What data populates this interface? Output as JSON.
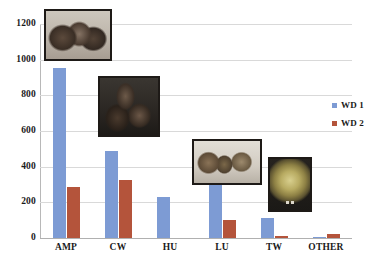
{
  "chart_data": {
    "type": "bar",
    "title": "",
    "subtitle": "",
    "xlabel": "",
    "ylabel": "",
    "categories": [
      "AMP",
      "CW",
      "HU",
      "LU",
      "TW",
      "OTHER"
    ],
    "series": [
      {
        "name": "WD 1",
        "color": "#7d9bd4",
        "values": [
          955,
          488,
          230,
          308,
          112,
          5
        ]
      },
      {
        "name": "WD 2",
        "color": "#b4543b",
        "values": [
          285,
          325,
          0,
          100,
          10,
          22
        ]
      }
    ],
    "ylim": [
      0,
      1200
    ],
    "yticks": [
      0,
      200,
      400,
      600,
      800,
      1000,
      1200
    ],
    "ytick_labels": [
      "0",
      "200",
      "400",
      "600",
      "800",
      "1000",
      "1200"
    ],
    "grid": true,
    "grid_axis": "y",
    "legend_position": "right",
    "legend_entries": [
      "WD 1",
      "WD 2"
    ]
  },
  "legend": {
    "items": [
      {
        "label": "WD 1",
        "color": "#7d9bd4"
      },
      {
        "label": "WD 2",
        "color": "#b4543b"
      }
    ]
  },
  "insets": [
    {
      "name": "amphorae-photo",
      "caption": ""
    },
    {
      "name": "jugs-photo",
      "caption": ""
    },
    {
      "name": "sherds-photo",
      "caption": ""
    },
    {
      "name": "glazed-dish-photo",
      "caption": ""
    }
  ],
  "colors": {
    "series_1": "#7d9bd4",
    "series_2": "#b4543b",
    "gridline": "#d9d9d9",
    "axis": "#b8b8b8",
    "text": "#1a1a1a",
    "background": "#ffffff"
  }
}
